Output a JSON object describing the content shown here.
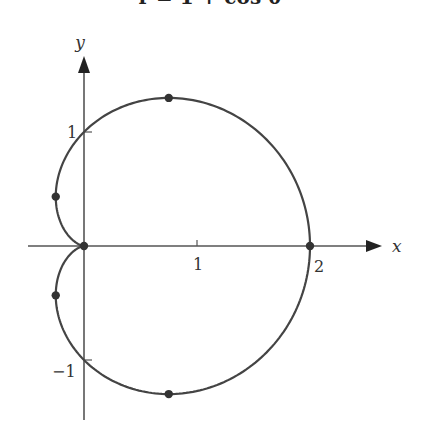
{
  "chart_data": {
    "type": "line",
    "title": "r = 1 + cos θ",
    "xlabel": "x",
    "ylabel": "y",
    "xlim": [
      -0.5,
      2.6
    ],
    "ylim": [
      -1.6,
      1.65
    ],
    "grid": false,
    "x_ticks": [
      {
        "value": 1,
        "label": "1"
      },
      {
        "value": 2,
        "label": "2"
      }
    ],
    "y_ticks": [
      {
        "value": 1,
        "label": "1"
      },
      {
        "value": -1,
        "label": "−1"
      }
    ],
    "curve": {
      "equation": "r = 1 + cos θ",
      "kind": "polar cardioid",
      "theta_range": [
        0,
        6.2832
      ]
    },
    "marked_points": [
      {
        "x": 0,
        "y": 0
      },
      {
        "x": 2,
        "y": 0
      },
      {
        "x": 0.75,
        "y": 1.299
      },
      {
        "x": 0.75,
        "y": -1.299
      },
      {
        "x": -0.25,
        "y": 0.433
      },
      {
        "x": -0.25,
        "y": -0.433
      }
    ],
    "colors": {
      "curve": "#444444",
      "axes": "#555555",
      "points": "#333333"
    }
  }
}
